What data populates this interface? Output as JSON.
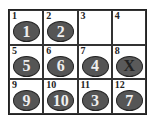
{
  "cells": [
    {
      "index": "1",
      "tile": "1"
    },
    {
      "index": "2",
      "tile": "2"
    },
    {
      "index": "3",
      "tile": ""
    },
    {
      "index": "4",
      "tile": ""
    },
    {
      "index": "5",
      "tile": "5"
    },
    {
      "index": "6",
      "tile": "6"
    },
    {
      "index": "7",
      "tile": "4"
    },
    {
      "index": "8",
      "tile": "X"
    },
    {
      "index": "9",
      "tile": "9"
    },
    {
      "index": "10",
      "tile": "10"
    },
    {
      "index": "11",
      "tile": "3"
    },
    {
      "index": "12",
      "tile": "7"
    }
  ]
}
